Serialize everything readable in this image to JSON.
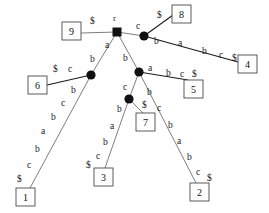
{
  "figure": {
    "kind": "suffix-tree",
    "root_label": "r",
    "colors": {
      "node_fill": "#111111",
      "edge_light": "#6f6f6f",
      "edge_dark": "#1a1a1a",
      "leaf_border": "#4a4a4a",
      "background": "#ffffff",
      "text": "#1a1a1a"
    }
  },
  "nodes": {
    "root": {
      "name": "r",
      "shape": "square",
      "x": 117,
      "y": 32
    },
    "n_c": {
      "name": "c-node",
      "shape": "circle",
      "x": 144,
      "y": 36
    },
    "n_b": {
      "name": "b-left-node",
      "shape": "circle",
      "x": 91,
      "y": 75
    },
    "n_mid": {
      "name": "b-mid-node",
      "shape": "circle",
      "x": 139,
      "y": 72
    },
    "n_low": {
      "name": "c-low-node",
      "shape": "circle",
      "x": 129,
      "y": 99
    }
  },
  "leaves": [
    {
      "id": "leaf-9",
      "label": "9",
      "x": 62,
      "y": 22,
      "w": 19,
      "h": 18
    },
    {
      "id": "leaf-8",
      "label": "8",
      "x": 172,
      "y": 5,
      "w": 19,
      "h": 18
    },
    {
      "id": "leaf-4",
      "label": "4",
      "x": 238,
      "y": 55,
      "w": 19,
      "h": 18
    },
    {
      "id": "leaf-6",
      "label": "6",
      "x": 28,
      "y": 76,
      "w": 19,
      "h": 18
    },
    {
      "id": "leaf-5",
      "label": "5",
      "x": 184,
      "y": 80,
      "w": 19,
      "h": 18
    },
    {
      "id": "leaf-7",
      "label": "7",
      "x": 136,
      "y": 113,
      "w": 19,
      "h": 18
    },
    {
      "id": "leaf-3",
      "label": "3",
      "x": 94,
      "y": 168,
      "w": 19,
      "h": 18
    },
    {
      "id": "leaf-1",
      "label": "1",
      "x": 16,
      "y": 188,
      "w": 19,
      "h": 18
    },
    {
      "id": "leaf-2",
      "label": "2",
      "x": 190,
      "y": 183,
      "w": 19,
      "h": 18
    }
  ],
  "edges": [
    {
      "id": "edge-root-9",
      "from": "root",
      "to": "leaf-9",
      "style": "light",
      "x1": 117,
      "y1": 32,
      "x2": 81,
      "y2": 33,
      "chars": "$"
    },
    {
      "id": "edge-root-c",
      "from": "root",
      "to": "n_c",
      "style": "light",
      "x1": 117,
      "y1": 32,
      "x2": 144,
      "y2": 36,
      "chars": "c"
    },
    {
      "id": "edge-c-8",
      "from": "n_c",
      "to": "leaf-8",
      "style": "dark",
      "x1": 144,
      "y1": 36,
      "x2": 173,
      "y2": 15,
      "chars": "$"
    },
    {
      "id": "edge-c-4",
      "from": "n_c",
      "to": "leaf-4",
      "style": "dark",
      "x1": 144,
      "y1": 36,
      "x2": 238,
      "y2": 62,
      "chars": "b a b c $"
    },
    {
      "id": "edge-root-a",
      "from": "root",
      "to": "n_b",
      "style": "light",
      "x1": 117,
      "y1": 32,
      "x2": 91,
      "y2": 75,
      "chars": "a b"
    },
    {
      "id": "edge-root-b",
      "from": "root",
      "to": "n_mid",
      "style": "light",
      "x1": 117,
      "y1": 32,
      "x2": 139,
      "y2": 72,
      "chars": "b"
    },
    {
      "id": "edge-b-6",
      "from": "n_b",
      "to": "leaf-6",
      "style": "dark",
      "x1": 91,
      "y1": 75,
      "x2": 47,
      "y2": 85,
      "chars": "$ c"
    },
    {
      "id": "edge-b-1",
      "from": "n_b",
      "to": "leaf-1",
      "style": "light",
      "x1": 91,
      "y1": 75,
      "x2": 30,
      "y2": 188,
      "chars": "b c b a b c $"
    },
    {
      "id": "edge-mid-5",
      "from": "n_mid",
      "to": "leaf-5",
      "style": "dark",
      "x1": 139,
      "y1": 72,
      "x2": 188,
      "y2": 80,
      "chars": "a b c $"
    },
    {
      "id": "edge-mid-low",
      "from": "n_mid",
      "to": "n_low",
      "style": "light",
      "x1": 139,
      "y1": 72,
      "x2": 129,
      "y2": 99,
      "chars": "c"
    },
    {
      "id": "edge-mid-2",
      "from": "n_mid",
      "to": "leaf-2",
      "style": "light",
      "x1": 139,
      "y1": 72,
      "x2": 196,
      "y2": 183,
      "chars": "b c b a b c $"
    },
    {
      "id": "edge-low-7",
      "from": "n_low",
      "to": "leaf-7",
      "style": "light",
      "x1": 129,
      "y1": 99,
      "x2": 143,
      "y2": 113,
      "chars": "$"
    },
    {
      "id": "edge-low-3",
      "from": "n_low",
      "to": "leaf-3",
      "style": "light",
      "x1": 129,
      "y1": 99,
      "x2": 105,
      "y2": 168,
      "chars": "b a b c $"
    }
  ],
  "edge_labels": [
    {
      "id": "label-root-r",
      "text": "r",
      "x": 113,
      "y": 14
    },
    {
      "id": "label-root-9-dollar",
      "text": "$",
      "x": 90,
      "y": 17
    },
    {
      "id": "label-root-c",
      "text": "c",
      "x": 136,
      "y": 22
    },
    {
      "id": "label-c-8-dollar",
      "text": "$",
      "x": 157,
      "y": 11
    },
    {
      "id": "label-c-4-b",
      "text": "b",
      "x": 154,
      "y": 37
    },
    {
      "id": "label-c-4-a",
      "text": "a",
      "x": 178,
      "y": 39
    },
    {
      "id": "label-c-4-b2",
      "text": "b",
      "x": 202,
      "y": 47
    },
    {
      "id": "label-c-4-c",
      "text": "c",
      "x": 219,
      "y": 51
    },
    {
      "id": "label-c-4-dollar",
      "text": "$",
      "x": 232,
      "y": 54
    },
    {
      "id": "label-root-a",
      "text": "a",
      "x": 105,
      "y": 41
    },
    {
      "id": "label-root-a-b",
      "text": "b",
      "x": 90,
      "y": 55
    },
    {
      "id": "label-root-b",
      "text": "b",
      "x": 123,
      "y": 54
    },
    {
      "id": "label-b-6-dollar",
      "text": "$",
      "x": 53,
      "y": 65
    },
    {
      "id": "label-b-6-c",
      "text": "c",
      "x": 68,
      "y": 65
    },
    {
      "id": "label-b-1-b",
      "text": "b",
      "x": 71,
      "y": 86
    },
    {
      "id": "label-b-1-c",
      "text": "c",
      "x": 61,
      "y": 99
    },
    {
      "id": "label-b-1-b2",
      "text": "b",
      "x": 51,
      "y": 113
    },
    {
      "id": "label-b-1-a",
      "text": "a",
      "x": 41,
      "y": 127
    },
    {
      "id": "label-b-1-b3",
      "text": "b",
      "x": 35,
      "y": 145
    },
    {
      "id": "label-b-1-c2",
      "text": "c",
      "x": 27,
      "y": 161
    },
    {
      "id": "label-b-1-dollar",
      "text": "$",
      "x": 17,
      "y": 175
    },
    {
      "id": "label-mid-a",
      "text": "a",
      "x": 148,
      "y": 64
    },
    {
      "id": "label-mid-5-b",
      "text": "b",
      "x": 166,
      "y": 69
    },
    {
      "id": "label-mid-5-c",
      "text": "c",
      "x": 180,
      "y": 70
    },
    {
      "id": "label-mid-5-dollar",
      "text": "$",
      "x": 192,
      "y": 70
    },
    {
      "id": "label-mid-low-c",
      "text": "c",
      "x": 123,
      "y": 83
    },
    {
      "id": "label-mid-2-b",
      "text": "b",
      "x": 147,
      "y": 88
    },
    {
      "id": "label-mid-2-c",
      "text": "c",
      "x": 157,
      "y": 104
    },
    {
      "id": "label-mid-2-b2",
      "text": "b",
      "x": 168,
      "y": 121
    },
    {
      "id": "label-mid-2-a",
      "text": "a",
      "x": 177,
      "y": 137
    },
    {
      "id": "label-mid-2-b3",
      "text": "b",
      "x": 187,
      "y": 153
    },
    {
      "id": "label-mid-2-c2",
      "text": "c",
      "x": 196,
      "y": 168
    },
    {
      "id": "label-mid-2-dollar",
      "text": "$",
      "x": 207,
      "y": 174
    },
    {
      "id": "label-low-7-dollar",
      "text": "$",
      "x": 142,
      "y": 101
    },
    {
      "id": "label-low-3-b",
      "text": "b",
      "x": 117,
      "y": 105
    },
    {
      "id": "label-low-3-a",
      "text": "a",
      "x": 110,
      "y": 122
    },
    {
      "id": "label-low-3-b2",
      "text": "b",
      "x": 103,
      "y": 138
    },
    {
      "id": "label-low-3-c",
      "text": "c",
      "x": 96,
      "y": 152
    },
    {
      "id": "label-low-3-dollar",
      "text": "$",
      "x": 86,
      "y": 161
    }
  ]
}
